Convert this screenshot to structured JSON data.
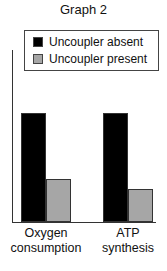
{
  "chart_data": {
    "type": "bar",
    "title": "Graph 2",
    "xlabel": "",
    "ylabel": "",
    "categories": [
      "Oxygen consumption",
      "ATP synthesis"
    ],
    "category_lines": [
      [
        "Oxygen",
        "consumption"
      ],
      [
        "ATP",
        "synthesis"
      ]
    ],
    "series": [
      {
        "name": "Uncoupler absent",
        "color": "#000000",
        "values": [
          100,
          100
        ]
      },
      {
        "name": "Uncoupler present",
        "color": "#a6a6a6",
        "values": [
          39,
          30
        ]
      }
    ],
    "ylim": [
      0,
      115
    ],
    "y_ticks": "none",
    "grid": false,
    "legend_position": "top, inside"
  }
}
